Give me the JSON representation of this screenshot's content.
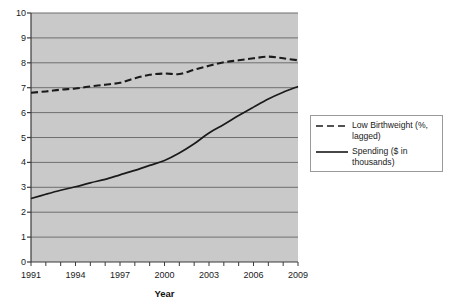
{
  "chart_data": {
    "type": "line",
    "title": "",
    "xlabel": "Year",
    "ylabel": "",
    "x": [
      1991,
      1992,
      1993,
      1994,
      1995,
      1996,
      1997,
      1998,
      1999,
      2000,
      2001,
      2002,
      2003,
      2004,
      2005,
      2006,
      2007,
      2008,
      2009
    ],
    "xlim": [
      1991,
      2009
    ],
    "ylim": [
      0,
      10
    ],
    "y_ticks": [
      0,
      1,
      2,
      3,
      4,
      5,
      6,
      7,
      8,
      9,
      10
    ],
    "x_tick_labels": [
      "1991",
      "1994",
      "1997",
      "2000",
      "2003",
      "2006",
      "2009"
    ],
    "x_tick_values": [
      1991,
      1994,
      1997,
      2000,
      2003,
      2006,
      2009
    ],
    "grid": "horizontal",
    "legend_position": "right",
    "plot_background": "#c9c9c9",
    "gridline_color": "#6f6f6f",
    "series": [
      {
        "name": "Low Birthweight (%, lagged)",
        "style": "dashed",
        "color": "#1a1a1a",
        "values": [
          6.8,
          6.85,
          6.92,
          6.97,
          7.05,
          7.12,
          7.2,
          7.38,
          7.52,
          7.57,
          7.55,
          7.72,
          7.88,
          8.02,
          8.1,
          8.18,
          8.25,
          8.18,
          8.1
        ]
      },
      {
        "name": "Spending ($ in thousands)",
        "style": "solid",
        "color": "#1a1a1a",
        "values": [
          2.55,
          2.72,
          2.88,
          3.02,
          3.18,
          3.32,
          3.5,
          3.68,
          3.88,
          4.08,
          4.38,
          4.75,
          5.18,
          5.52,
          5.88,
          6.22,
          6.55,
          6.82,
          7.05
        ]
      }
    ]
  },
  "legend": {
    "entries": [
      {
        "label": "Low Birthweight (%, lagged)",
        "style": "dashed"
      },
      {
        "label": "Spending ($ in thousands)",
        "style": "solid"
      }
    ]
  },
  "axis": {
    "x_title": "Year"
  }
}
